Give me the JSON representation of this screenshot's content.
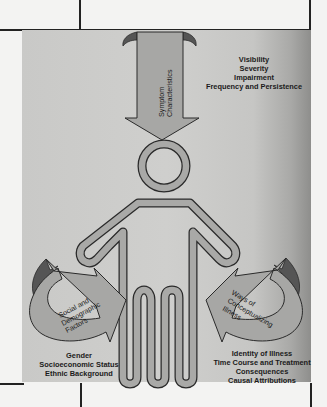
{
  "diagram": {
    "center_figure": "person-figure",
    "arrows": {
      "top": {
        "label_line1": "Symptom",
        "label_line2": "Characteristics",
        "items": [
          "Visibility",
          "Severity",
          "Impairment",
          "Frequency and Persistence"
        ]
      },
      "left": {
        "label_line1": "Social and",
        "label_line2": "Demographic",
        "label_line3": "Factors",
        "items": [
          "Gender",
          "Socioeconomic Status",
          "Ethnic Background"
        ]
      },
      "right": {
        "label_line1": "Ways of",
        "label_line2": "Conceptualizing",
        "label_line3": "Illness",
        "items": [
          "Identity of Illness",
          "Time Course and Treatment",
          "Consequences",
          "Causal Attributions"
        ]
      }
    },
    "colors": {
      "arrow_fill": "#a7a7a5",
      "arrow_dark": "#555555",
      "outline": "#2a2a2a",
      "figure_fill": "#a9a9a7"
    }
  }
}
